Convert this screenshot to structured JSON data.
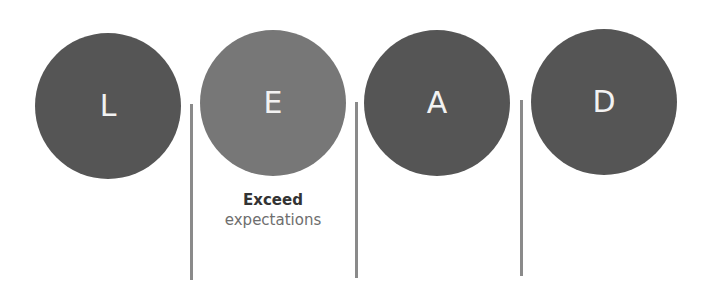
{
  "diagram": {
    "acronym": "LEAD",
    "colors": {
      "dark_circle": "#555555",
      "light_circle": "#777777",
      "divider": "#8a8a8a",
      "letter": "#f2f2f2"
    },
    "circles": [
      {
        "letter": "L",
        "shade": "dark"
      },
      {
        "letter": "E",
        "shade": "light"
      },
      {
        "letter": "A",
        "shade": "dark"
      },
      {
        "letter": "D",
        "shade": "dark"
      }
    ],
    "captions": [
      {
        "for": "E",
        "bold": "Exceed",
        "normal": "expectations"
      }
    ]
  }
}
